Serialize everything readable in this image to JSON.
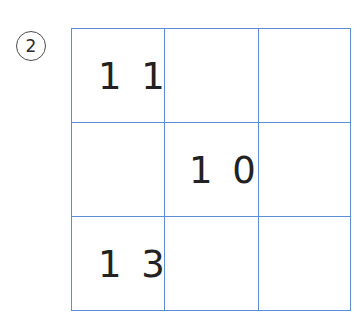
{
  "worksheet": {
    "item_number": "2",
    "grid": {
      "rows": 3,
      "columns": 3,
      "line_color": "#5b8ed6",
      "cells": [
        [
          {
            "value": "1 1",
            "name": "cell-r0-c0"
          },
          {
            "value": "",
            "name": "cell-r0-c1"
          },
          {
            "value": "",
            "name": "cell-r0-c2"
          }
        ],
        [
          {
            "value": "",
            "name": "cell-r1-c0"
          },
          {
            "value": "1 0",
            "name": "cell-r1-c1"
          },
          {
            "value": "",
            "name": "cell-r1-c2"
          }
        ],
        [
          {
            "value": "1 3",
            "name": "cell-r2-c0"
          },
          {
            "value": "",
            "name": "cell-r2-c1"
          },
          {
            "value": "",
            "name": "cell-r2-c2"
          }
        ]
      ]
    },
    "colors": {
      "grid_line": "#5b8ed6",
      "digit": "#222222",
      "marker_stroke": "#4d4d4d",
      "background": "#ffffff"
    }
  }
}
